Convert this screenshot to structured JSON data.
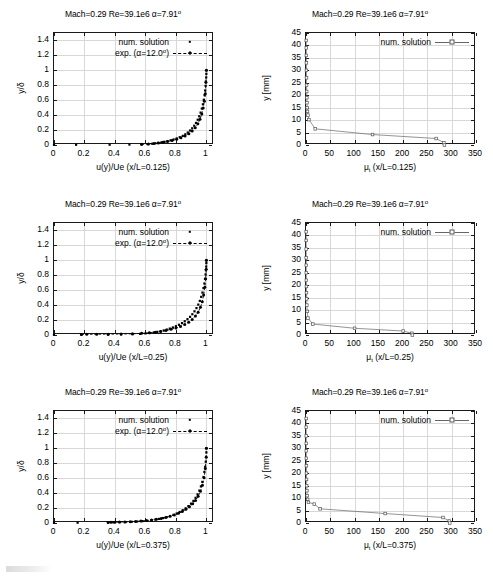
{
  "figure": {
    "title_common": "Mach=0.29 Re=39.1e6 α=7.91",
    "title_sup": "o"
  },
  "panels": [
    {
      "id": "velocity-profile-x-0125",
      "title": "Mach=0.29 Re=39.1e6 α=7.91º",
      "xlabel": "u(y)/Ue (x/L=0.125)",
      "ylabel": "y/δ"
    },
    {
      "id": "eddy-viscosity-x-0125",
      "title": "Mach=0.29 Re=39.1e6 α=7.91º",
      "xlabel": "μ_t (x/L=0.125)",
      "ylabel": "y [mm]"
    },
    {
      "id": "velocity-profile-x-025",
      "title": "Mach=0.29 Re=39.1e6 α=7.91º",
      "xlabel": "u(y)/Ue (x/L=0.25)",
      "ylabel": "y/δ"
    },
    {
      "id": "eddy-viscosity-x-025",
      "title": "Mach=0.29 Re=39.1e6 α=7.91º",
      "xlabel": "μ_t (x/L=0.25)",
      "ylabel": "y [mm]"
    },
    {
      "id": "velocity-profile-x-0375",
      "title": "Mach=0.29 Re=39.1e6 α=7.91º",
      "xlabel": "u(y)/Ue (x/L=0.375)",
      "ylabel": "y/δ"
    },
    {
      "id": "eddy-viscosity-x-0375",
      "title": "Mach=0.29 Re=39.1e6 α=7.91º",
      "xlabel": "μ_t (x/L=0.375)",
      "ylabel": "y [mm]"
    }
  ],
  "labels": {
    "num_solution": "num. solution",
    "exp_solution": "exp. (α=12.0º)",
    "exp_prefix": "exp. (α=12.0",
    "exp_sup": "o",
    "exp_suffix": ")",
    "mu_symbol": "μ",
    "mu_sub": "t",
    "xlabel_mu_0125": " (x/L=0.125)",
    "xlabel_mu_025": " (x/L=0.25)",
    "xlabel_mu_0375": " (x/L=0.375)",
    "xlabel_u_0125": "u(y)/Ue (x/L=0.125)",
    "xlabel_u_025": "u(y)/Ue (x/L=0.25)",
    "xlabel_u_0375": "u(y)/Ue (x/L=0.375)",
    "ylabel_delta": "y/δ",
    "ylabel_mm": "y [mm]",
    "title": "Mach=0.29 Re=39.1e6 α=7.91",
    "title_deg": "o"
  },
  "colors": {
    "axis": "#1a1a1a",
    "grid": "#d8d8d8",
    "data_points": "#000000",
    "num_line": "#666666",
    "background": "#ffffff"
  },
  "chart_data": [
    {
      "type": "scatter",
      "id": "velocity-profile-x-0125",
      "title": "Mach=0.29 Re=39.1e6 α=7.91º",
      "xlabel": "u(y)/Ue (x/L=0.125)",
      "ylabel": "y/δ",
      "xlim": [
        0,
        1.05
      ],
      "ylim": [
        0,
        1.5
      ],
      "xticks": [
        0,
        0.2,
        0.4,
        0.6,
        0.8,
        1
      ],
      "yticks": [
        0,
        0.2,
        0.4,
        0.6,
        0.8,
        1,
        1.2,
        1.4
      ],
      "xticklabels": [
        "0",
        "0.2",
        "0.4",
        "0.6",
        "0.8",
        "1"
      ],
      "yticklabels": [
        "0",
        "0.2",
        "0.4",
        "0.6",
        "0.8",
        "1",
        "1.2",
        "1.4"
      ],
      "grid": true,
      "legend_position": "top-right",
      "series": [
        {
          "name": "num. solution",
          "style": "points",
          "x": [
            0.0,
            0.145,
            0.365,
            0.495,
            0.575,
            0.615,
            0.645,
            0.665,
            0.685,
            0.705,
            0.725,
            0.745,
            0.765,
            0.785,
            0.805,
            0.825,
            0.845,
            0.862,
            0.878,
            0.893,
            0.907,
            0.92,
            0.932,
            0.943,
            0.953,
            0.962,
            0.97,
            0.977,
            0.983,
            0.988,
            0.992,
            0.995,
            0.997,
            0.999,
            1.0,
            1.0
          ],
          "y": [
            0.002,
            0.003,
            0.004,
            0.006,
            0.008,
            0.012,
            0.017,
            0.022,
            0.028,
            0.035,
            0.043,
            0.052,
            0.062,
            0.074,
            0.088,
            0.104,
            0.122,
            0.143,
            0.167,
            0.194,
            0.224,
            0.258,
            0.296,
            0.338,
            0.384,
            0.434,
            0.488,
            0.545,
            0.606,
            0.668,
            0.731,
            0.793,
            0.852,
            0.906,
            0.954,
            1.0
          ]
        },
        {
          "name": "exp. (α=12.0º)",
          "style": "line-points-dashed",
          "x": [
            0.575,
            0.62,
            0.655,
            0.685,
            0.715,
            0.745,
            0.775,
            0.805,
            0.833,
            0.86,
            0.885,
            0.907,
            0.927,
            0.944,
            0.958,
            0.97,
            0.979,
            0.987,
            0.993,
            0.997,
            1.0
          ],
          "y": [
            0.009,
            0.014,
            0.02,
            0.027,
            0.036,
            0.047,
            0.06,
            0.077,
            0.097,
            0.122,
            0.152,
            0.188,
            0.231,
            0.283,
            0.344,
            0.415,
            0.495,
            0.585,
            0.685,
            0.84,
            1.0
          ]
        }
      ]
    },
    {
      "type": "line",
      "id": "eddy-viscosity-x-0125",
      "title": "Mach=0.29 Re=39.1e6 α=7.91º",
      "xlabel": "μ_t (x/L=0.125)",
      "ylabel": "y [mm]",
      "xlim": [
        0,
        350
      ],
      "ylim": [
        0,
        45
      ],
      "xticks": [
        0,
        50,
        100,
        150,
        200,
        250,
        300,
        350
      ],
      "yticks": [
        0,
        5,
        10,
        15,
        20,
        25,
        30,
        35,
        40,
        45
      ],
      "xticklabels": [
        "0",
        "50",
        "100",
        "150",
        "200",
        "250",
        "300",
        "350"
      ],
      "yticklabels": [
        "0",
        "5",
        "10",
        "15",
        "20",
        "25",
        "30",
        "35",
        "40",
        "45"
      ],
      "grid": true,
      "legend_position": "top-right",
      "series": [
        {
          "name": "num. solution",
          "style": "line-points",
          "x": [
            0.5,
            0.6,
            0.7,
            0.8,
            0.9,
            1.0,
            1.2,
            1.4,
            1.7,
            2.0,
            2.4,
            3.0,
            4.0,
            6.0,
            19.0,
            137.0,
            268.0,
            284.0,
            285.0
          ],
          "y": [
            42.0,
            39.0,
            36.0,
            33.0,
            30.0,
            27.0,
            24.0,
            21.5,
            19.0,
            17.0,
            15.0,
            13.5,
            12.0,
            10.2,
            6.5,
            4.2,
            2.6,
            0.9,
            0.0
          ]
        }
      ]
    },
    {
      "type": "scatter",
      "id": "velocity-profile-x-025",
      "title": "Mach=0.29 Re=39.1e6 α=7.91º",
      "xlabel": "u(y)/Ue (x/L=0.25)",
      "ylabel": "y/δ",
      "xlim": [
        0,
        1.05
      ],
      "ylim": [
        0,
        1.5
      ],
      "xticks": [
        0,
        0.2,
        0.4,
        0.6,
        0.8,
        1
      ],
      "yticks": [
        0,
        0.2,
        0.4,
        0.6,
        0.8,
        1,
        1.2,
        1.4
      ],
      "xticklabels": [
        "0",
        "0.2",
        "0.4",
        "0.6",
        "0.8",
        "1"
      ],
      "yticklabels": [
        "0",
        "0.2",
        "0.4",
        "0.6",
        "0.8",
        "1",
        "1.2",
        "1.4"
      ],
      "grid": true,
      "legend_position": "top-right",
      "series": [
        {
          "name": "num. solution",
          "style": "points",
          "x": [
            0.0,
            0.18,
            0.355,
            0.44,
            0.515,
            0.565,
            0.6,
            0.63,
            0.655,
            0.678,
            0.7,
            0.72,
            0.74,
            0.76,
            0.78,
            0.8,
            0.82,
            0.84,
            0.858,
            0.876,
            0.893,
            0.908,
            0.922,
            0.935,
            0.947,
            0.957,
            0.966,
            0.974,
            0.981,
            0.987,
            0.991,
            0.995,
            0.997,
            0.999,
            1.0,
            1.0
          ],
          "y": [
            0.002,
            0.004,
            0.006,
            0.008,
            0.011,
            0.015,
            0.021,
            0.027,
            0.034,
            0.042,
            0.051,
            0.061,
            0.073,
            0.086,
            0.101,
            0.118,
            0.137,
            0.159,
            0.184,
            0.212,
            0.243,
            0.278,
            0.317,
            0.36,
            0.407,
            0.457,
            0.511,
            0.568,
            0.628,
            0.69,
            0.752,
            0.812,
            0.868,
            0.918,
            0.962,
            1.0
          ]
        },
        {
          "name": "exp. (α=12.0º)",
          "style": "line-points-dashed",
          "x": [
            0.18,
            0.215,
            0.28,
            0.355,
            0.44,
            0.515,
            0.575,
            0.625,
            0.665,
            0.7,
            0.735,
            0.768,
            0.8,
            0.83,
            0.858,
            0.884,
            0.907,
            0.928,
            0.946,
            0.961,
            0.973,
            0.982,
            0.99,
            0.995,
            0.999,
            1.0
          ],
          "y": [
            0.008,
            0.009,
            0.01,
            0.011,
            0.013,
            0.016,
            0.022,
            0.029,
            0.038,
            0.048,
            0.061,
            0.076,
            0.094,
            0.115,
            0.141,
            0.172,
            0.209,
            0.253,
            0.306,
            0.37,
            0.446,
            0.535,
            0.64,
            0.755,
            0.88,
            1.0
          ]
        }
      ]
    },
    {
      "type": "line",
      "id": "eddy-viscosity-x-025",
      "title": "Mach=0.29 Re=39.1e6 α=7.91º",
      "xlabel": "μ_t (x/L=0.25)",
      "ylabel": "y [mm]",
      "xlim": [
        0,
        350
      ],
      "ylim": [
        0,
        45
      ],
      "xticks": [
        0,
        50,
        100,
        150,
        200,
        250,
        300,
        350
      ],
      "yticks": [
        0,
        5,
        10,
        15,
        20,
        25,
        30,
        35,
        40,
        45
      ],
      "xticklabels": [
        "0",
        "50",
        "100",
        "150",
        "200",
        "250",
        "300",
        "350"
      ],
      "yticklabels": [
        "0",
        "5",
        "10",
        "15",
        "20",
        "25",
        "30",
        "35",
        "40",
        "45"
      ],
      "grid": true,
      "legend_position": "top-right",
      "series": [
        {
          "name": "num. solution",
          "style": "line-points",
          "x": [
            0.3,
            0.35,
            0.4,
            0.45,
            0.5,
            0.6,
            0.7,
            0.85,
            1.0,
            1.3,
            1.8,
            2.6,
            4.0,
            14.0,
            100.0,
            200.0,
            218.0,
            219.0
          ],
          "y": [
            41.5,
            38.0,
            34.5,
            31.0,
            28.0,
            25.0,
            22.0,
            19.5,
            17.0,
            14.5,
            12.0,
            9.5,
            6.8,
            4.4,
            2.7,
            1.6,
            0.7,
            0.0
          ]
        }
      ]
    },
    {
      "type": "scatter",
      "id": "velocity-profile-x-0375",
      "title": "Mach=0.29 Re=39.1e6 α=7.91º",
      "xlabel": "u(y)/Ue (x/L=0.375)",
      "ylabel": "y/δ",
      "xlim": [
        0,
        1.05
      ],
      "ylim": [
        0,
        1.5
      ],
      "xticks": [
        0,
        0.2,
        0.4,
        0.6,
        0.8,
        1
      ],
      "yticks": [
        0,
        0.2,
        0.4,
        0.6,
        0.8,
        1,
        1.2,
        1.4
      ],
      "xticklabels": [
        "0",
        "0.2",
        "0.4",
        "0.6",
        "0.8",
        "1"
      ],
      "yticklabels": [
        "0",
        "0.2",
        "0.4",
        "0.6",
        "0.8",
        "1",
        "1.2",
        "1.4"
      ],
      "grid": true,
      "legend_position": "top-right",
      "series": [
        {
          "name": "num. solution",
          "style": "points",
          "x": [
            0.0,
            0.155,
            0.355,
            0.39,
            0.43,
            0.47,
            0.51,
            0.545,
            0.58,
            0.61,
            0.64,
            0.665,
            0.69,
            0.715,
            0.74,
            0.762,
            0.784,
            0.805,
            0.825,
            0.845,
            0.864,
            0.882,
            0.899,
            0.915,
            0.929,
            0.942,
            0.954,
            0.964,
            0.973,
            0.981,
            0.987,
            0.992,
            0.996,
            0.998,
            1.0,
            1.0
          ],
          "y": [
            0.002,
            0.004,
            0.007,
            0.009,
            0.011,
            0.013,
            0.016,
            0.02,
            0.025,
            0.031,
            0.038,
            0.046,
            0.055,
            0.066,
            0.079,
            0.093,
            0.109,
            0.127,
            0.148,
            0.171,
            0.197,
            0.226,
            0.259,
            0.296,
            0.337,
            0.383,
            0.434,
            0.49,
            0.551,
            0.616,
            0.684,
            0.753,
            0.82,
            0.885,
            0.945,
            1.0
          ]
        },
        {
          "name": "exp. (α=12.0º)",
          "style": "line-points-dashed",
          "x": [
            0.355,
            0.375,
            0.4,
            0.43,
            0.465,
            0.5,
            0.535,
            0.57,
            0.605,
            0.64,
            0.672,
            0.703,
            0.733,
            0.762,
            0.79,
            0.817,
            0.842,
            0.866,
            0.889,
            0.91,
            0.929,
            0.946,
            0.961,
            0.974,
            0.985,
            0.993,
            0.999,
            1.0
          ],
          "y": [
            0.008,
            0.009,
            0.01,
            0.012,
            0.014,
            0.017,
            0.021,
            0.026,
            0.032,
            0.04,
            0.05,
            0.061,
            0.074,
            0.09,
            0.108,
            0.129,
            0.154,
            0.183,
            0.217,
            0.257,
            0.303,
            0.358,
            0.424,
            0.505,
            0.605,
            0.73,
            0.88,
            1.0
          ]
        }
      ]
    },
    {
      "type": "line",
      "id": "eddy-viscosity-x-0375",
      "title": "Mach=0.29 Re=39.1e6 α=7.91º",
      "xlabel": "μ_t (x/L=0.375)",
      "ylabel": "y [mm]",
      "xlim": [
        0,
        350
      ],
      "ylim": [
        0,
        45
      ],
      "xticks": [
        0,
        50,
        100,
        150,
        200,
        250,
        300,
        350
      ],
      "yticks": [
        0,
        5,
        10,
        15,
        20,
        25,
        30,
        35,
        40,
        45
      ],
      "xticklabels": [
        "0",
        "50",
        "100",
        "150",
        "200",
        "250",
        "300",
        "350"
      ],
      "yticklabels": [
        "0",
        "5",
        "10",
        "15",
        "20",
        "25",
        "30",
        "35",
        "40",
        "45"
      ],
      "grid": true,
      "legend_position": "top-right",
      "series": [
        {
          "name": "num. solution",
          "style": "line-points",
          "x": [
            0.4,
            0.45,
            0.5,
            0.55,
            0.6,
            0.7,
            0.8,
            0.95,
            1.1,
            1.4,
            1.8,
            2.4,
            3.4,
            5.0,
            17.0,
            29.0,
            163.0,
            282.0,
            295.0,
            296.0
          ],
          "y": [
            42.0,
            38.5,
            35.0,
            32.0,
            29.0,
            26.0,
            23.0,
            20.0,
            17.5,
            15.0,
            13.0,
            11.0,
            9.5,
            8.3,
            7.6,
            5.7,
            3.8,
            2.2,
            0.8,
            0.0
          ]
        }
      ]
    }
  ]
}
